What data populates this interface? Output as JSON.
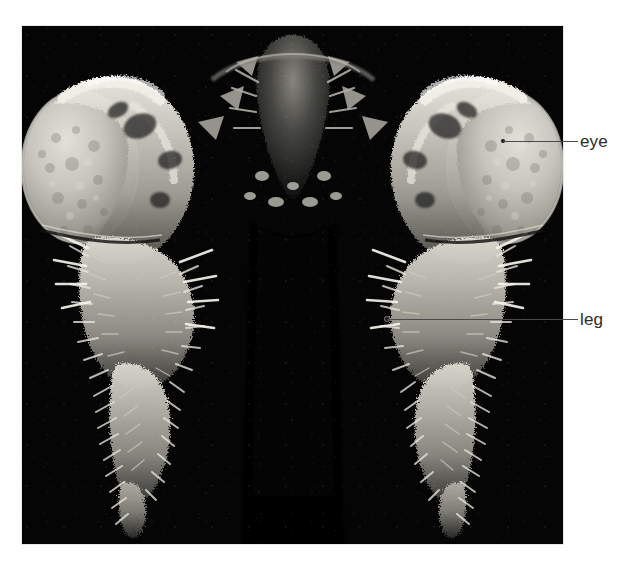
{
  "figure": {
    "type": "scanning-electron-micrograph",
    "background_color": "#fefefe",
    "plate_background_color": "#050505",
    "plate": {
      "x": 22,
      "y": 26,
      "width": 541,
      "height": 518
    }
  },
  "annotations": [
    {
      "id": "eye",
      "label": "eye",
      "label_x": 580,
      "label_y": 133,
      "line_x": 503,
      "line_y": 141,
      "line_width": 75,
      "dot_x": 501,
      "dot_y": 139,
      "line_color": "#4a4a4a",
      "text_color": "#2b2b2b"
    },
    {
      "id": "leg",
      "label": "leg",
      "label_x": 580,
      "label_y": 311,
      "line_x": 387,
      "line_y": 319,
      "line_width": 191,
      "dot_x": 385,
      "dot_y": 317,
      "line_color": "#4a4a4a",
      "text_color": "#2b2b2b"
    }
  ],
  "specimen": {
    "symmetry": "bilateral-mirror",
    "midline_x": 270,
    "structures": [
      {
        "name": "compound-eye-left",
        "cx": 96,
        "cy": 135,
        "rx": 62,
        "ry": 78,
        "tone": "#b9b7b0"
      },
      {
        "name": "compound-eye-right",
        "cx": 444,
        "cy": 135,
        "rx": 62,
        "ry": 78,
        "tone": "#b9b7b0"
      },
      {
        "name": "ectopic-leg-left",
        "cx": 150,
        "cy": 330,
        "tone": "#cfcdc6"
      },
      {
        "name": "ectopic-leg-right",
        "cx": 390,
        "cy": 330,
        "tone": "#cfcdc6"
      },
      {
        "name": "mouthparts-midline",
        "cx": 270,
        "cy": 120,
        "tone": "#6e6c68"
      }
    ]
  }
}
